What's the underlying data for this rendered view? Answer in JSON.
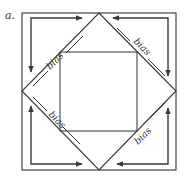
{
  "figure": {
    "panel_label": "a.",
    "labels": {
      "top_left": "bias",
      "top_right": "bias",
      "bottom_left": "bias",
      "bottom_right": "bias"
    },
    "colors": {
      "line": "#333333",
      "arrow": "#3a3a3a",
      "background": "#ffffff"
    },
    "shapes": [
      "outer-square",
      "diamond",
      "inner-square"
    ],
    "arrows_per_corner": 2
  }
}
